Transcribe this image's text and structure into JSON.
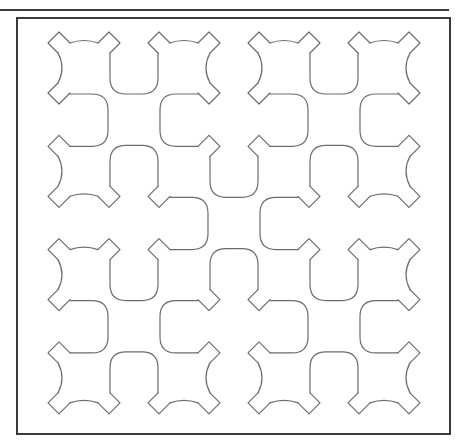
{
  "figure": {
    "colors": {
      "rule": "#3a3a3a",
      "frame": "#3a3a3a",
      "pattern": "#6b6b6b",
      "background": "#ffffff"
    },
    "top_rule": {
      "x1": 0,
      "x2": 449,
      "y": 10
    },
    "frame": {
      "x": 17,
      "y": 18,
      "width": 433,
      "height": 416
    },
    "grid": {
      "columns": 4,
      "rows": 4,
      "origin_x": 84,
      "origin_y": 68,
      "step_x": 100,
      "step_y": 103.3
    },
    "horizontal_links": [
      {
        "row": 0,
        "col": 0,
        "type": "U"
      },
      {
        "row": 0,
        "col": 2,
        "type": "U"
      },
      {
        "row": 1,
        "col": 0,
        "type": "N"
      },
      {
        "row": 1,
        "col": 1,
        "type": "U"
      },
      {
        "row": 1,
        "col": 2,
        "type": "N"
      },
      {
        "row": 2,
        "col": 0,
        "type": "U"
      },
      {
        "row": 2,
        "col": 1,
        "type": "N"
      },
      {
        "row": 2,
        "col": 2,
        "type": "U"
      },
      {
        "row": 3,
        "col": 0,
        "type": "N"
      },
      {
        "row": 3,
        "col": 2,
        "type": "N"
      }
    ],
    "vertical_links": [
      {
        "row": 0,
        "col": 0,
        "type": "right"
      },
      {
        "row": 0,
        "col": 1,
        "type": "left"
      },
      {
        "row": 0,
        "col": 2,
        "type": "right"
      },
      {
        "row": 0,
        "col": 3,
        "type": "left"
      },
      {
        "row": 1,
        "col": 1,
        "type": "right"
      },
      {
        "row": 1,
        "col": 2,
        "type": "left"
      },
      {
        "row": 2,
        "col": 0,
        "type": "right"
      },
      {
        "row": 2,
        "col": 1,
        "type": "left"
      },
      {
        "row": 2,
        "col": 2,
        "type": "right"
      },
      {
        "row": 2,
        "col": 3,
        "type": "left"
      }
    ]
  }
}
